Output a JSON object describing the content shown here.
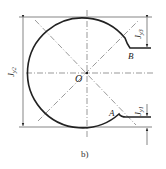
{
  "figure": {
    "caption": "b)",
    "labels": {
      "center": "O",
      "point_a": "A",
      "point_b": "B",
      "dim_left": "J",
      "dim_left_sub": "y2",
      "dim_top_right": "J",
      "dim_top_right_sub": "y3",
      "dim_bottom_right": "J",
      "dim_bottom_right_sub": "y1"
    }
  }
}
